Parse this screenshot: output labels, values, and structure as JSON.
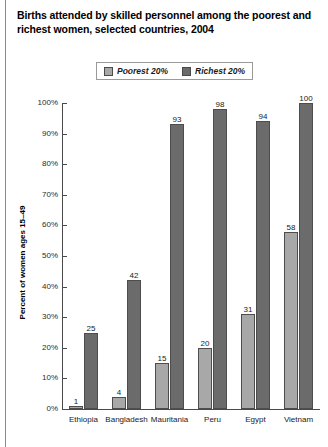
{
  "figure": {
    "title": "Births attended by skilled personnel among the poorest and richest women, selected countries, 2004"
  },
  "legend": {
    "position": "top-center",
    "entries": [
      {
        "label": "Poorest 20%",
        "color": "#a8a8a8"
      },
      {
        "label": "Richest 20%",
        "color": "#6b6b6b"
      }
    ]
  },
  "axes": {
    "y_title": "Percent of women ages 15–49",
    "y_ticks": [
      "100%",
      "90%",
      "80%",
      "70%",
      "60%",
      "50%",
      "40%",
      "30%",
      "20%",
      "10%",
      "0%"
    ]
  },
  "chart_data": {
    "type": "bar",
    "title": "Births attended by skilled personnel among the poorest and richest women, selected countries, 2004",
    "xlabel": "",
    "ylabel": "Percent of women ages 15–49",
    "ylim": [
      0,
      100
    ],
    "ytick_step": 10,
    "grid": false,
    "legend_position": "top-center",
    "categories": [
      "Ethiopia",
      "Bangladesh",
      "Mauritania",
      "Peru",
      "Egypt",
      "Vietnam"
    ],
    "series": [
      {
        "name": "Poorest 20%",
        "color": "#a8a8a8",
        "values": [
          1,
          4,
          15,
          20,
          31,
          58
        ]
      },
      {
        "name": "Richest 20%",
        "color": "#6b6b6b",
        "values": [
          25,
          42,
          93,
          98,
          94,
          100
        ]
      }
    ]
  }
}
